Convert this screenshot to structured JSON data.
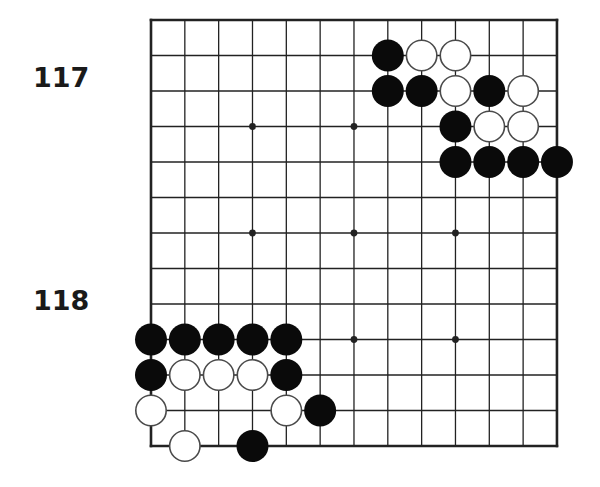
{
  "problems": [
    {
      "number": "117"
    },
    {
      "number": "118"
    }
  ],
  "board": {
    "size": 13,
    "origin_x": 151,
    "origin_y": 20,
    "spacing_x": 33.83,
    "spacing_y": 35.5,
    "stone_radius": 16,
    "line_color": "#222222",
    "border_width": 2.6,
    "line_width": 1.3,
    "black_color": "#0a0a0a",
    "white_fill": "#ffffff",
    "white_stroke": "#4a4a4a",
    "star_points": [
      [
        3,
        3
      ],
      [
        6,
        3
      ],
      [
        9,
        3
      ],
      [
        3,
        6
      ],
      [
        6,
        6
      ],
      [
        9,
        6
      ],
      [
        3,
        9
      ],
      [
        6,
        9
      ],
      [
        9,
        9
      ]
    ],
    "stones": [
      {
        "color": "black",
        "col": 7,
        "row": 1
      },
      {
        "color": "white",
        "col": 8,
        "row": 1
      },
      {
        "color": "white",
        "col": 9,
        "row": 1
      },
      {
        "color": "black",
        "col": 7,
        "row": 2
      },
      {
        "color": "black",
        "col": 8,
        "row": 2
      },
      {
        "color": "white",
        "col": 9,
        "row": 2
      },
      {
        "color": "black",
        "col": 10,
        "row": 2
      },
      {
        "color": "white",
        "col": 11,
        "row": 2
      },
      {
        "color": "black",
        "col": 9,
        "row": 3
      },
      {
        "color": "white",
        "col": 10,
        "row": 3
      },
      {
        "color": "white",
        "col": 11,
        "row": 3
      },
      {
        "color": "black",
        "col": 9,
        "row": 4
      },
      {
        "color": "black",
        "col": 10,
        "row": 4
      },
      {
        "color": "black",
        "col": 11,
        "row": 4
      },
      {
        "color": "black",
        "col": 12,
        "row": 4
      },
      {
        "color": "black",
        "col": 0,
        "row": 9
      },
      {
        "color": "black",
        "col": 1,
        "row": 9
      },
      {
        "color": "black",
        "col": 2,
        "row": 9
      },
      {
        "color": "black",
        "col": 3,
        "row": 9
      },
      {
        "color": "black",
        "col": 4,
        "row": 9
      },
      {
        "color": "black",
        "col": 0,
        "row": 10
      },
      {
        "color": "white",
        "col": 1,
        "row": 10
      },
      {
        "color": "white",
        "col": 2,
        "row": 10
      },
      {
        "color": "white",
        "col": 3,
        "row": 10
      },
      {
        "color": "black",
        "col": 4,
        "row": 10
      },
      {
        "color": "white",
        "col": 0,
        "row": 11
      },
      {
        "color": "white",
        "col": 4,
        "row": 11
      },
      {
        "color": "black",
        "col": 5,
        "row": 11
      },
      {
        "color": "white",
        "col": 1,
        "row": 12
      },
      {
        "color": "black",
        "col": 3,
        "row": 12
      }
    ]
  }
}
